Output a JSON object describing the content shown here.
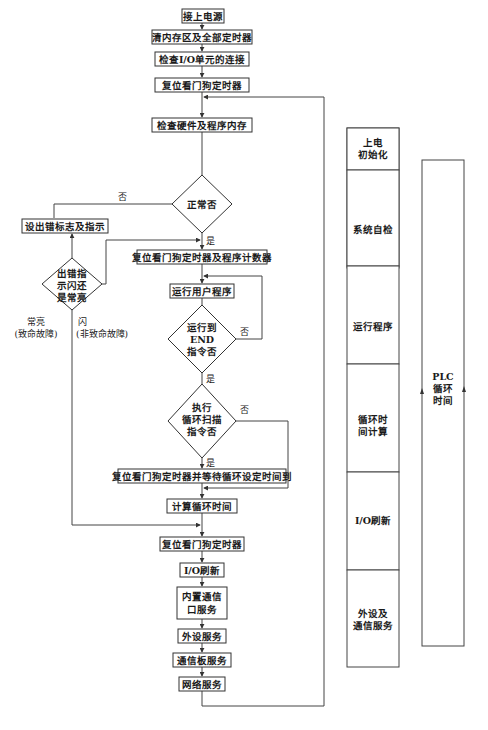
{
  "flowchart": {
    "steps": {
      "power_on": "接上电源",
      "clear_memory": "清内存区及全部定时器",
      "check_io": "检查I/O单元的连接",
      "reset_watchdog_1": "复位看门狗定时器",
      "check_hw": "检查硬件及程序内存",
      "error_flag": "设出错标志及指示",
      "reset_watchdog_pc": "复位看门狗定时器及程序计数器",
      "run_user_program": "运行用户程序",
      "reset_wait_cycle": "复位看门狗定时器并等待循环设定时间到",
      "calc_cycle_time": "计算循环时间",
      "reset_watchdog_2": "复位看门狗定时器",
      "io_refresh": "I/O刷新",
      "builtin_comm_line1": "内置通信",
      "builtin_comm_line2": "口服务",
      "peripheral_service": "外设服务",
      "comm_board_service": "通信板服务",
      "network_service": "网络服务"
    },
    "decisions": {
      "normal": "正常否",
      "error_blink_line1": "出错指",
      "error_blink_line2": "示闪还",
      "error_blink_line3": "是常亮",
      "run_to_end_line1": "运行到",
      "run_to_end_line2": "END",
      "run_to_end_line3": "指令否",
      "cycle_scan_line1": "执行",
      "cycle_scan_line2": "循环扫描",
      "cycle_scan_line3": "指令否"
    },
    "edge_labels": {
      "no_normal": "否",
      "yes_normal": "是",
      "no_end": "否",
      "yes_end": "是",
      "no_scan": "否",
      "yes_scan": "是",
      "steady_line1": "常亮",
      "steady_line2": "(致命故障)",
      "blink_line1": "闪",
      "blink_line2": "(非致命故障)"
    }
  },
  "phases": {
    "items": [
      {
        "line1": "上电",
        "line2": "初始化"
      },
      {
        "line1": "系统自检",
        "line2": ""
      },
      {
        "line1": "运行程序",
        "line2": ""
      },
      {
        "line1": "循环时",
        "line2": "间计算"
      },
      {
        "line1": "I/O刷新",
        "line2": ""
      },
      {
        "line1": "外设及",
        "line2": "通信服务"
      }
    ]
  },
  "cycle_time": {
    "line1": "PLC",
    "line2": "循环",
    "line3": "时间"
  }
}
